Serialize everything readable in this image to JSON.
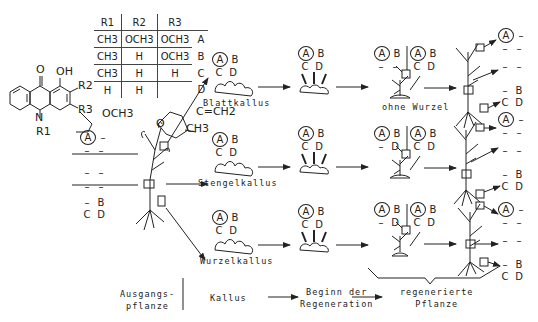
{
  "structure": {
    "labels": [
      "O",
      "OH",
      "R2",
      "R3",
      "N",
      "R1",
      "OCH3"
    ],
    "ring_numbers": [
      "1",
      "2",
      "3",
      "4"
    ],
    "side_chain_D": {
      "atoms": [
        "O",
        "C=CH2",
        "CH3"
      ],
      "numbers": [
        "3",
        "4"
      ]
    }
  },
  "substituent_table": {
    "headers": [
      "R1",
      "R2",
      "R3"
    ],
    "rows": [
      {
        "r1": "CH3",
        "r2": "OCH3",
        "r3": "OCH3",
        "label": "A"
      },
      {
        "r1": "CH3",
        "r2": "H",
        "r3": "OCH3",
        "label": "B"
      },
      {
        "r1": "CH3",
        "r2": "H",
        "r3": "H",
        "label": "C"
      },
      {
        "r1": "H",
        "r2": "H",
        "r3": "",
        "label": "D"
      }
    ]
  },
  "source_plant": {
    "grid": [
      [
        "A",
        "–"
      ],
      [
        "–",
        "–"
      ],
      [
        "–",
        "–"
      ],
      [
        "–",
        "–"
      ],
      [
        "–",
        "B"
      ],
      [
        "C",
        "D"
      ]
    ]
  },
  "callus": {
    "leaf": {
      "label": "Blattkallus",
      "grid": [
        [
          "A",
          "B"
        ],
        [
          "C",
          "D"
        ]
      ]
    },
    "stem": {
      "label": "Stengelkallus",
      "grid": [
        [
          "A",
          "B"
        ],
        [
          "C",
          "D"
        ]
      ]
    },
    "root": {
      "label": "Wurzelkallus",
      "grid": [
        [
          "A",
          "B"
        ],
        [
          "C",
          "D"
        ]
      ]
    }
  },
  "regeneration_begin": {
    "leaf": {
      "grid": [
        [
          "A",
          "B"
        ],
        [
          "C",
          "D"
        ]
      ]
    },
    "stem": {
      "grid": [
        [
          "A",
          "B"
        ],
        [
          "C",
          "D"
        ]
      ]
    },
    "root": {
      "grid": [
        [
          "A",
          "B"
        ],
        [
          "C",
          "D"
        ]
      ]
    }
  },
  "plantlet": {
    "leaf": {
      "left": [
        [
          "A",
          "B"
        ],
        [
          "–",
          "–"
        ]
      ],
      "right": [
        [
          "A",
          "B"
        ],
        [
          "C",
          "D"
        ]
      ],
      "note": "ohne Wurzel"
    },
    "stem": {
      "left": [
        [
          "A",
          "B"
        ],
        [
          "–",
          "D"
        ]
      ],
      "right": [
        [
          "A",
          "B"
        ],
        [
          "C",
          "D"
        ]
      ]
    },
    "root": {
      "left": [
        [
          "A",
          "B"
        ],
        [
          "–",
          "D"
        ]
      ],
      "right": [
        [
          "A",
          "B"
        ],
        [
          "C",
          "D"
        ]
      ]
    }
  },
  "regenerated_plant": {
    "leaf": {
      "top": [
        [
          "A",
          "–"
        ],
        [
          "–",
          "–"
        ]
      ],
      "middle": [
        [
          "–",
          "–"
        ]
      ],
      "bottom": [
        [
          "–",
          "B"
        ],
        [
          "C",
          "D"
        ]
      ]
    },
    "stem": {
      "top": [
        [
          "A",
          "–"
        ],
        [
          "–",
          "–"
        ]
      ],
      "middle": [
        [
          "–",
          "–"
        ]
      ],
      "bottom": [
        [
          "–",
          "B"
        ],
        [
          "C",
          "D"
        ]
      ]
    },
    "root": {
      "top": [
        [
          "A",
          "–"
        ],
        [
          "–",
          "–"
        ]
      ],
      "middle": [
        [
          "–",
          "–"
        ]
      ],
      "bottom": [
        [
          "–",
          "B"
        ],
        [
          "C",
          "D"
        ]
      ]
    }
  },
  "stages": {
    "source": "Ausgangs-\npflanze",
    "callus": "Kallus",
    "begin": "Beginn der\nRegeneration",
    "regenerated": "regenerierte\nPflanze"
  },
  "colors": {
    "ink": "#222222",
    "background": "#ffffff"
  }
}
